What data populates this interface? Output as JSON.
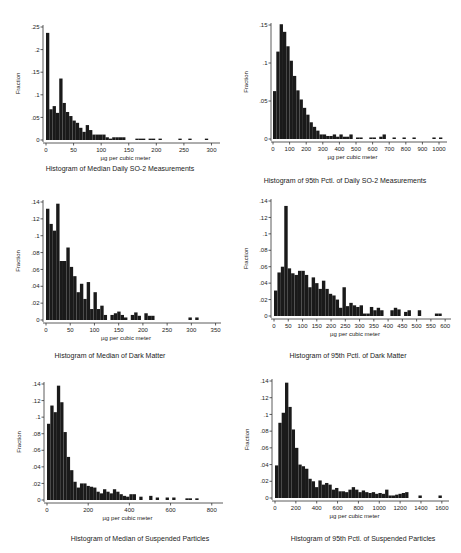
{
  "chart_data": [
    {
      "type": "bar",
      "title": "Histogram of Median Daily SO-2 Measurements",
      "xlabel": "µg per cubic meter",
      "ylabel": "Fraction",
      "xlim": [
        0,
        310
      ],
      "ylim": [
        0,
        0.25
      ],
      "xticks": [
        "0",
        "50",
        "100",
        "150",
        "200",
        "250",
        "300"
      ],
      "xtick_values": [
        0,
        50,
        100,
        150,
        200,
        250,
        300
      ],
      "yticks": [
        "0",
        ".05",
        ".1",
        ".15",
        ".2",
        ".25"
      ],
      "ytick_values": [
        0,
        0.05,
        0.1,
        0.15,
        0.2,
        0.25
      ],
      "bin_width": 6,
      "bin_start": 0,
      "values": [
        0.237,
        0.068,
        0.075,
        0.06,
        0.136,
        0.082,
        0.062,
        0.053,
        0.043,
        0.038,
        0.027,
        0.018,
        0.033,
        0.022,
        0.012,
        0.012,
        0.012,
        0.012,
        0.006,
        0.003,
        0.006,
        0.006,
        0.006,
        0.006,
        0.0,
        0.0,
        0.0,
        0.003,
        0.003,
        0.003,
        0.0,
        0.003,
        0.003,
        0.0,
        0.003,
        0.0,
        0.0,
        0.0,
        0.0,
        0.0,
        0.003,
        0.0,
        0.0,
        0.003,
        0.0,
        0.0,
        0.0,
        0.0,
        0.003,
        0.0,
        0.0
      ]
    },
    {
      "type": "bar",
      "title": "Histogram of 95th Pctl. of Daily SO-2 Measurements",
      "xlabel": "µg per cubic meter",
      "ylabel": "Fraction",
      "xlim": [
        0,
        1030
      ],
      "ylim": [
        0,
        0.15
      ],
      "xticks": [
        "0",
        "100",
        "200",
        "300",
        "400",
        "500",
        "600",
        "700",
        "800",
        "900",
        "1000"
      ],
      "xtick_values": [
        0,
        100,
        200,
        300,
        400,
        500,
        600,
        700,
        800,
        900,
        1000
      ],
      "yticks": [
        "0",
        ".05",
        ".1",
        ".15"
      ],
      "ytick_values": [
        0,
        0.05,
        0.1,
        0.15
      ],
      "bin_width": 20,
      "bin_start": 0,
      "values": [
        0.063,
        0.115,
        0.151,
        0.141,
        0.122,
        0.103,
        0.083,
        0.064,
        0.052,
        0.041,
        0.032,
        0.022,
        0.016,
        0.011,
        0.006,
        0.006,
        0.004,
        0.004,
        0.006,
        0.003,
        0.006,
        0.003,
        0.003,
        0.006,
        0.0,
        0.002,
        0.002,
        0.0,
        0.0,
        0.002,
        0.002,
        0.0,
        0.003,
        0.006,
        0.0,
        0.0,
        0.002,
        0.0,
        0.0,
        0.002,
        0.0,
        0.0,
        0.002,
        0.0,
        0.0,
        0.0,
        0.0,
        0.0,
        0.002,
        0.0,
        0.002
      ]
    },
    {
      "type": "bar",
      "title": "Histogram of Median of Dark Matter",
      "xlabel": "µg per cubic meter",
      "ylabel": "Fraction",
      "xlim": [
        0,
        355
      ],
      "ylim": [
        0,
        0.14
      ],
      "xticks": [
        "0",
        "50",
        "100",
        "150",
        "200",
        "250",
        "300",
        "350"
      ],
      "xtick_values": [
        0,
        50,
        100,
        150,
        200,
        250,
        300,
        350
      ],
      "yticks": [
        "0",
        ".02",
        ".04",
        ".06",
        ".08",
        ".1",
        ".12",
        ".14"
      ],
      "ytick_values": [
        0,
        0.02,
        0.04,
        0.06,
        0.08,
        0.1,
        0.12,
        0.14
      ],
      "bin_width": 7,
      "bin_start": 0,
      "values": [
        0.132,
        0.114,
        0.106,
        0.138,
        0.07,
        0.07,
        0.086,
        0.063,
        0.052,
        0.033,
        0.043,
        0.025,
        0.045,
        0.013,
        0.033,
        0.013,
        0.017,
        0.006,
        0.0,
        0.006,
        0.008,
        0.01,
        0.006,
        0.003,
        0.0,
        0.006,
        0.009,
        0.005,
        0.0,
        0.008,
        0.005,
        0.005,
        0.0,
        0.0,
        0.0,
        0.0,
        0.0,
        0.0,
        0.0,
        0.0,
        0.0,
        0.0,
        0.003,
        0.0,
        0.003
      ]
    },
    {
      "type": "bar",
      "title": "Histogram of 95th Pctl. of Dark Matter",
      "xlabel": "µg per cubic meter",
      "ylabel": "Fraction",
      "xlim": [
        0,
        610
      ],
      "ylim": [
        0,
        0.14
      ],
      "xticks": [
        "0",
        "50",
        "100",
        "150",
        "200",
        "250",
        "300",
        "350",
        "400",
        "450",
        "500",
        "550",
        "600"
      ],
      "xtick_values": [
        0,
        50,
        100,
        150,
        200,
        250,
        300,
        350,
        400,
        450,
        500,
        550,
        600
      ],
      "yticks": [
        "0",
        ".02",
        ".04",
        ".06",
        ".08",
        ".1",
        ".12",
        ".14"
      ],
      "ytick_values": [
        0,
        0.02,
        0.04,
        0.06,
        0.08,
        0.1,
        0.12,
        0.14
      ],
      "bin_width": 12,
      "bin_start": 0,
      "values": [
        0.031,
        0.053,
        0.06,
        0.134,
        0.058,
        0.052,
        0.05,
        0.055,
        0.055,
        0.05,
        0.035,
        0.047,
        0.04,
        0.033,
        0.043,
        0.033,
        0.027,
        0.025,
        0.02,
        0.01,
        0.035,
        0.012,
        0.016,
        0.013,
        0.011,
        0.013,
        0.003,
        0.003,
        0.011,
        0.007,
        0.01,
        0.007,
        0.0,
        0.0,
        0.007,
        0.01,
        0.008,
        0.0,
        0.005,
        0.007,
        0.0,
        0.0,
        0.007,
        0.0,
        0.0,
        0.0,
        0.0,
        0.003,
        0.003
      ]
    },
    {
      "type": "bar",
      "title": "Histogram of Median of Suspended Particles",
      "xlabel": "µg per cubic meter",
      "ylabel": "Fraction",
      "xlim": [
        0,
        840
      ],
      "ylim": [
        0,
        0.14
      ],
      "xticks": [
        "0",
        "200",
        "400",
        "600",
        "800"
      ],
      "xtick_values": [
        0,
        200,
        400,
        600,
        800
      ],
      "yticks": [
        "0",
        ".02",
        ".04",
        ".06",
        ".08",
        ".1",
        ".12",
        ".14"
      ],
      "ytick_values": [
        0,
        0.02,
        0.04,
        0.06,
        0.08,
        0.1,
        0.12,
        0.14
      ],
      "bin_width": 16,
      "bin_start": 0,
      "values": [
        0.092,
        0.114,
        0.106,
        0.138,
        0.118,
        0.082,
        0.052,
        0.036,
        0.022,
        0.015,
        0.02,
        0.02,
        0.017,
        0.016,
        0.015,
        0.01,
        0.008,
        0.013,
        0.01,
        0.008,
        0.013,
        0.01,
        0.007,
        0.005,
        0.004,
        0.007,
        0.007,
        0.0,
        0.004,
        0.0,
        0.0,
        0.005,
        0.0,
        0.003,
        0.0,
        0.0,
        0.003,
        0.0,
        0.003,
        0.0,
        0.0,
        0.0,
        0.002,
        0.002,
        0.0,
        0.002,
        0.0
      ]
    },
    {
      "type": "bar",
      "title": "Histogram of 95th Pctl. of Suspended Particles",
      "xlabel": "µg per cubic meter",
      "ylabel": "Fraction",
      "xlim": [
        0,
        1640
      ],
      "ylim": [
        0,
        0.14
      ],
      "xticks": [
        "0",
        "200",
        "400",
        "600",
        "800",
        "1000",
        "1200",
        "1400",
        "1600"
      ],
      "xtick_values": [
        0,
        200,
        400,
        600,
        800,
        1000,
        1200,
        1400,
        1600
      ],
      "yticks": [
        "0",
        ".02",
        ".04",
        ".06",
        ".08",
        ".1",
        ".12",
        ".14"
      ],
      "ytick_values": [
        0,
        0.02,
        0.04,
        0.06,
        0.08,
        0.1,
        0.12,
        0.14
      ],
      "bin_width": 32,
      "bin_start": 0,
      "values": [
        0.039,
        0.09,
        0.102,
        0.138,
        0.109,
        0.082,
        0.06,
        0.04,
        0.038,
        0.035,
        0.023,
        0.02,
        0.013,
        0.021,
        0.016,
        0.018,
        0.016,
        0.01,
        0.012,
        0.008,
        0.008,
        0.007,
        0.01,
        0.013,
        0.01,
        0.007,
        0.009,
        0.007,
        0.006,
        0.007,
        0.005,
        0.006,
        0.005,
        0.01,
        0.003,
        0.003,
        0.004,
        0.005,
        0.006,
        0.007,
        0.0,
        0.0,
        0.0,
        0.003,
        0.0,
        0.0,
        0.0,
        0.0,
        0.0,
        0.003,
        0.0
      ]
    }
  ],
  "layout": [
    {
      "x0": 46,
      "x1": 217,
      "yBase": 140,
      "yTop": 27,
      "axisX": 43,
      "titleX": 120,
      "titleY": 160
    },
    {
      "x0": 273,
      "x1": 444,
      "yBase": 139,
      "yTop": 25,
      "axisX": 271,
      "titleX": 345,
      "titleY": 172
    },
    {
      "x0": 46,
      "x1": 218,
      "yBase": 320,
      "yTop": 202,
      "axisX": 43,
      "titleX": 110,
      "titleY": 347
    },
    {
      "x0": 274,
      "x1": 448,
      "yBase": 316,
      "yTop": 201,
      "axisX": 271,
      "titleX": 348,
      "titleY": 347
    },
    {
      "x0": 47,
      "x1": 220,
      "yBase": 500,
      "yTop": 384,
      "axisX": 44,
      "titleX": 140,
      "titleY": 530
    },
    {
      "x0": 275,
      "x1": 446,
      "yBase": 498,
      "yTop": 381,
      "axisX": 272,
      "titleX": 363,
      "titleY": 530
    }
  ],
  "colors": {
    "bar": "#1a1a1a",
    "axis": "#333333",
    "text": "#222222"
  }
}
